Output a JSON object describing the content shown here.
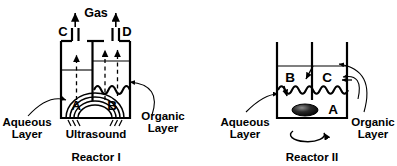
{
  "figure": {
    "type": "schematic-diagram",
    "stroke_color": "#000000",
    "background_color": "#ffffff"
  },
  "reactor_one": {
    "caption": "Reactor I",
    "gas_label": "Gas",
    "port_left_label": "C",
    "port_right_label": "D",
    "species_left_label": "A",
    "species_right_label": "B",
    "energy_source_label": "Ultrasound",
    "left_phase_label_line1": "Aqueous",
    "left_phase_label_line2": "Layer",
    "right_phase_label_line1": "Organic",
    "right_phase_label_line2": "Layer"
  },
  "reactor_two": {
    "caption": "Reactor II",
    "species_upper_left_label": "B",
    "species_upper_right_label": "C",
    "species_lower_label": "A",
    "left_phase_label_line1": "Aqueous",
    "left_phase_label_line2": "Layer",
    "right_phase_label_line1": "Organic",
    "right_phase_label_line2": "Layer"
  }
}
